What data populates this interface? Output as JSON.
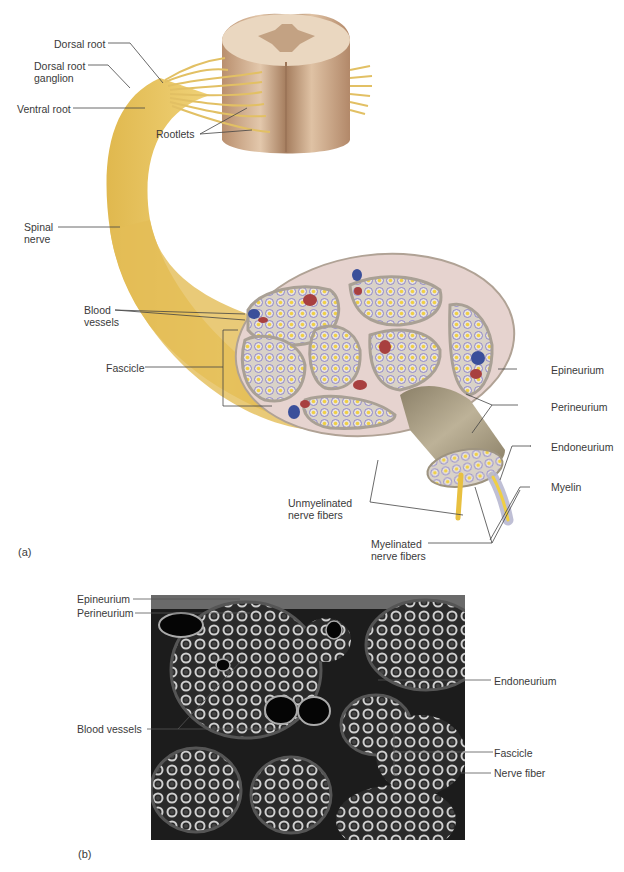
{
  "figure": {
    "panel_a": {
      "label": "(a)",
      "labels": {
        "dorsal_root": "Dorsal root",
        "dorsal_root_ganglion": [
          "Dorsal root",
          "ganglion"
        ],
        "ventral_root": "Ventral root",
        "rootlets": "Rootlets",
        "spinal_nerve": [
          "Spinal",
          "nerve"
        ],
        "blood_vessels": [
          "Blood",
          "vessels"
        ],
        "fascicle": "Fascicle",
        "epineurium": "Epineurium",
        "perineurium": "Perineurium",
        "endoneurium": "Endoneurium",
        "myelin": "Myelin",
        "unmyelinated": [
          "Unmyelinated",
          "nerve fibers"
        ],
        "myelinated": [
          "Myelinated",
          "nerve fibers"
        ]
      }
    },
    "panel_b": {
      "label": "(b)",
      "labels": {
        "epineurium": "Epineurium",
        "perineurium": "Perineurium",
        "blood_vessels": "Blood vessels",
        "endoneurium": "Endoneurium",
        "fascicle": "Fascicle",
        "nerve_fiber": "Nerve fiber"
      }
    },
    "colors": {
      "nerve": "#e8c66a",
      "cord": "#c9a98a",
      "sheath": "#d7cfc4",
      "fiber_ring": "#8e86c9",
      "axon": "#f0cf44",
      "vein": "#3a4f9a",
      "artery": "#a8403f",
      "sem_bg": "#1a1a1a"
    }
  }
}
